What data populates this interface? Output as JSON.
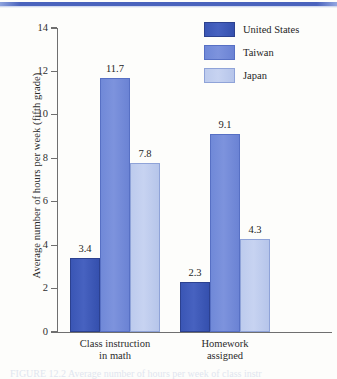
{
  "figure": {
    "top_rule": "blue-rule",
    "caption_partial": "FIGURE 12.2  Average number of hours per week of class instr"
  },
  "legend": {
    "position": "top-right",
    "entries": [
      {
        "label": "United States",
        "color": "#3a56b5"
      },
      {
        "label": "Taiwan",
        "color": "#7089d8"
      },
      {
        "label": "Japan",
        "color": "#bdcbed"
      }
    ]
  },
  "axes": {
    "y_title": "Average number of hours per week (fifth grade)",
    "y_ticks": [
      "14",
      "12",
      "10",
      "8",
      "6",
      "4",
      "2",
      "0"
    ],
    "x_categories": [
      {
        "line1": "Class instruction",
        "line2": "in math"
      },
      {
        "line1": "Homework",
        "line2": "assigned"
      }
    ]
  },
  "chart_data": {
    "type": "bar",
    "title": "",
    "subtitle": "",
    "xlabel": "",
    "ylabel": "Average number of hours per week (fifth grade)",
    "ylim": [
      0,
      14
    ],
    "ytick_step": 2,
    "yticks": [
      0,
      2,
      4,
      6,
      8,
      10,
      12,
      14
    ],
    "grid": false,
    "legend_position": "top-right",
    "categories": [
      "Class instruction in math",
      "Homework assigned"
    ],
    "series": [
      {
        "name": "United States",
        "color": "#3a56b5",
        "values": [
          3.4,
          2.3
        ]
      },
      {
        "name": "Taiwan",
        "color": "#7089d8",
        "values": [
          11.7,
          9.1
        ]
      },
      {
        "name": "Japan",
        "color": "#bdcbed",
        "values": [
          7.8,
          4.3
        ]
      }
    ],
    "data_labels": [
      {
        "series": "United States",
        "category": "Class instruction in math",
        "value": "3.4"
      },
      {
        "series": "Taiwan",
        "category": "Class instruction in math",
        "value": "11.7"
      },
      {
        "series": "Japan",
        "category": "Class instruction in math",
        "value": "7.8"
      },
      {
        "series": "United States",
        "category": "Homework assigned",
        "value": "2.3"
      },
      {
        "series": "Taiwan",
        "category": "Homework assigned",
        "value": "9.1"
      },
      {
        "series": "Japan",
        "category": "Homework assigned",
        "value": "4.3"
      }
    ]
  }
}
